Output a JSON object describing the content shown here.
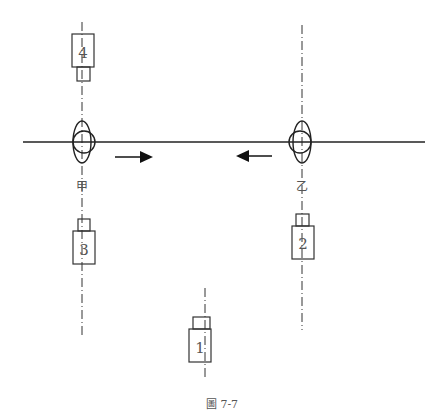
{
  "diagram": {
    "caption": "圖 7-7",
    "main_line": {
      "x1": 23,
      "x2": 425,
      "y": 142
    },
    "axes": [
      {
        "id": "left",
        "x": 82,
        "y1": 22,
        "y2": 335
      },
      {
        "id": "right",
        "x": 302,
        "y1": 25,
        "y2": 330
      },
      {
        "id": "center",
        "x": 205,
        "y1": 288,
        "y2": 378
      }
    ],
    "nodes": [
      {
        "id": "jia",
        "label": "甲",
        "x": 82,
        "y": 142
      },
      {
        "id": "yi",
        "label": "乙",
        "x": 302,
        "y": 142
      }
    ],
    "units": [
      {
        "id": "4",
        "label": "4"
      },
      {
        "id": "3",
        "label": "3"
      },
      {
        "id": "2",
        "label": "2"
      },
      {
        "id": "1",
        "label": "1"
      }
    ],
    "arrows": [
      {
        "direction": "right",
        "x1": 115,
        "x2": 153,
        "y": 157
      },
      {
        "direction": "left",
        "x1": 272,
        "x2": 236,
        "y": 156
      }
    ],
    "colors": {
      "stroke": "#222222",
      "label": "#555555"
    }
  }
}
